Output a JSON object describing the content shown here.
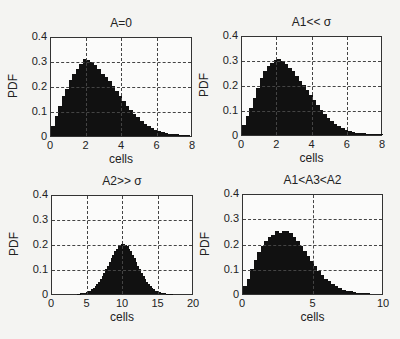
{
  "figure": {
    "ylabel": "PDF",
    "xlabel": "cells"
  },
  "chart_data": [
    {
      "type": "bar",
      "title": "A=0",
      "xlabel": "cells",
      "ylabel": "PDF",
      "xlim": [
        0,
        8
      ],
      "ylim": [
        0,
        0.4
      ],
      "xticks": [
        "0",
        "2",
        "4",
        "6",
        "8"
      ],
      "yticks": [
        "0",
        "0.1",
        "0.2",
        "0.3",
        "0.4"
      ],
      "grid": true,
      "bin_width": 0.2,
      "x": [
        0.1,
        0.3,
        0.5,
        0.7,
        0.9,
        1.1,
        1.3,
        1.5,
        1.7,
        1.9,
        2.1,
        2.3,
        2.5,
        2.7,
        2.9,
        3.1,
        3.3,
        3.5,
        3.7,
        3.9,
        4.1,
        4.3,
        4.5,
        4.7,
        4.9,
        5.1,
        5.3,
        5.5,
        5.7,
        5.9,
        6.1,
        6.3,
        6.5,
        6.7,
        6.9,
        7.1,
        7.3,
        7.5,
        7.7
      ],
      "values": [
        0.04,
        0.08,
        0.12,
        0.16,
        0.19,
        0.225,
        0.25,
        0.27,
        0.29,
        0.31,
        0.305,
        0.295,
        0.285,
        0.27,
        0.25,
        0.235,
        0.22,
        0.2,
        0.18,
        0.16,
        0.14,
        0.12,
        0.105,
        0.09,
        0.075,
        0.06,
        0.05,
        0.04,
        0.032,
        0.025,
        0.02,
        0.015,
        0.012,
        0.01,
        0.008,
        0.007,
        0.006,
        0.006,
        0.006
      ]
    },
    {
      "type": "bar",
      "title": "A1<< σ",
      "xlabel": "cells",
      "ylabel": "PDF",
      "xlim": [
        0,
        8
      ],
      "ylim": [
        0,
        0.4
      ],
      "xticks": [
        "0",
        "2",
        "4",
        "6",
        "8"
      ],
      "yticks": [
        "0",
        "0.1",
        "0.2",
        "0.3",
        "0.4"
      ],
      "grid": true,
      "bin_width": 0.2,
      "x": [
        0.1,
        0.3,
        0.5,
        0.7,
        0.9,
        1.1,
        1.3,
        1.5,
        1.7,
        1.9,
        2.1,
        2.3,
        2.5,
        2.7,
        2.9,
        3.1,
        3.3,
        3.5,
        3.7,
        3.9,
        4.1,
        4.3,
        4.5,
        4.7,
        4.9,
        5.1,
        5.3,
        5.5,
        5.7,
        5.9,
        6.1,
        6.3,
        6.5,
        6.7,
        6.9,
        7.1,
        7.3,
        7.5,
        7.7,
        7.9
      ],
      "values": [
        0.04,
        0.075,
        0.11,
        0.15,
        0.19,
        0.23,
        0.255,
        0.275,
        0.29,
        0.3,
        0.305,
        0.295,
        0.285,
        0.27,
        0.255,
        0.235,
        0.215,
        0.2,
        0.18,
        0.16,
        0.14,
        0.12,
        0.1,
        0.085,
        0.07,
        0.058,
        0.045,
        0.036,
        0.028,
        0.022,
        0.017,
        0.013,
        0.01,
        0.008,
        0.007,
        0.006,
        0.005,
        0.005,
        0.004,
        0.005
      ]
    },
    {
      "type": "bar",
      "title": "A2>> σ",
      "xlabel": "cells",
      "ylabel": "PDF",
      "xlim": [
        0,
        20
      ],
      "ylim": [
        0,
        0.4
      ],
      "xticks": [
        "0",
        "5",
        "10",
        "15",
        "20"
      ],
      "yticks": [
        "0",
        "0.1",
        "0.2",
        "0.3",
        "0.4"
      ],
      "grid": true,
      "bin_width": 0.25,
      "mean": 10,
      "std": 2,
      "peak": 0.2,
      "x_range": [
        3.5,
        17
      ]
    },
    {
      "type": "bar",
      "title": "A1<A3<A2",
      "xlabel": "cells",
      "ylabel": "PDF",
      "xlim": [
        0,
        10
      ],
      "ylim": [
        0,
        0.4
      ],
      "xticks": [
        "0",
        "5",
        "10"
      ],
      "yticks": [
        "0",
        "0.1",
        "0.2",
        "0.3",
        "0.4"
      ],
      "grid": true,
      "bin_width": 0.25,
      "x": [
        0.125,
        0.375,
        0.625,
        0.875,
        1.125,
        1.375,
        1.625,
        1.875,
        2.125,
        2.375,
        2.625,
        2.875,
        3.125,
        3.375,
        3.625,
        3.875,
        4.125,
        4.375,
        4.625,
        4.875,
        5.125,
        5.375,
        5.625,
        5.875,
        6.125,
        6.375,
        6.625,
        6.875,
        7.125,
        7.375,
        7.625,
        7.875,
        8.125,
        8.375,
        8.625,
        8.875
      ],
      "values": [
        0.03,
        0.06,
        0.1,
        0.135,
        0.165,
        0.19,
        0.21,
        0.225,
        0.235,
        0.25,
        0.24,
        0.25,
        0.25,
        0.24,
        0.225,
        0.21,
        0.19,
        0.17,
        0.15,
        0.13,
        0.11,
        0.09,
        0.075,
        0.06,
        0.05,
        0.04,
        0.03,
        0.022,
        0.017,
        0.012,
        0.01,
        0.008,
        0.006,
        0.005,
        0.004,
        0.006
      ]
    }
  ]
}
